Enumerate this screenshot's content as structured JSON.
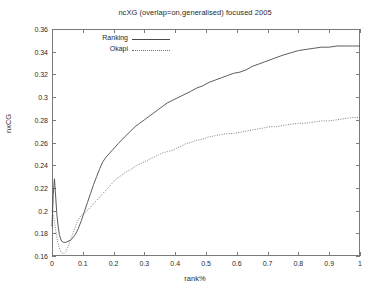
{
  "chart_data": {
    "type": "line",
    "title": "ncXG (overlap=on,generalised) focused 2005",
    "xlabel": "rank%",
    "ylabel": "nxCG",
    "xlim": [
      0,
      1
    ],
    "ylim": [
      0.16,
      0.36
    ],
    "grid": false,
    "legend_position": "top-left-inside",
    "xticks": [
      "0",
      "0.1",
      "0.2",
      "0.3",
      "0.4",
      "0.5",
      "0.6",
      "0.7",
      "0.8",
      "0.9",
      "1"
    ],
    "xtick_values": [
      0,
      0.1,
      0.2,
      0.3,
      0.4,
      0.5,
      0.6,
      0.7,
      0.8,
      0.9,
      1
    ],
    "yticks": [
      "0.16",
      "0.18",
      "0.2",
      "0.22",
      "0.24",
      "0.26",
      "0.28",
      "0.3",
      "0.32",
      "0.34",
      "0.36"
    ],
    "ytick_values": [
      0.16,
      0.18,
      0.2,
      0.22,
      0.24,
      0.26,
      0.28,
      0.3,
      0.32,
      0.34,
      0.36
    ],
    "series": [
      {
        "name": "Ranking",
        "style": "solid",
        "color": "#4a4a4a",
        "x": [
          0.0,
          0.004,
          0.008,
          0.012,
          0.016,
          0.02,
          0.024,
          0.028,
          0.032,
          0.038,
          0.045,
          0.052,
          0.06,
          0.068,
          0.076,
          0.085,
          0.095,
          0.105,
          0.115,
          0.125,
          0.135,
          0.145,
          0.155,
          0.165,
          0.175,
          0.185,
          0.195,
          0.205,
          0.215,
          0.225,
          0.24,
          0.255,
          0.27,
          0.285,
          0.3,
          0.315,
          0.33,
          0.345,
          0.36,
          0.375,
          0.39,
          0.405,
          0.42,
          0.435,
          0.45,
          0.47,
          0.49,
          0.51,
          0.53,
          0.55,
          0.57,
          0.59,
          0.61,
          0.63,
          0.65,
          0.67,
          0.69,
          0.71,
          0.73,
          0.75,
          0.775,
          0.8,
          0.825,
          0.85,
          0.875,
          0.9,
          0.925,
          0.95,
          0.975,
          1.0
        ],
        "y": [
          0.186,
          0.214,
          0.228,
          0.212,
          0.196,
          0.186,
          0.179,
          0.175,
          0.173,
          0.172,
          0.172,
          0.173,
          0.174,
          0.176,
          0.179,
          0.184,
          0.191,
          0.199,
          0.207,
          0.215,
          0.223,
          0.23,
          0.237,
          0.243,
          0.247,
          0.25,
          0.253,
          0.256,
          0.259,
          0.262,
          0.266,
          0.27,
          0.274,
          0.277,
          0.28,
          0.283,
          0.286,
          0.289,
          0.292,
          0.295,
          0.297,
          0.299,
          0.301,
          0.303,
          0.305,
          0.308,
          0.31,
          0.313,
          0.315,
          0.317,
          0.319,
          0.321,
          0.322,
          0.324,
          0.327,
          0.329,
          0.331,
          0.333,
          0.335,
          0.337,
          0.339,
          0.341,
          0.342,
          0.343,
          0.344,
          0.344,
          0.345,
          0.345,
          0.345,
          0.345
        ]
      },
      {
        "name": "Okapi",
        "style": "dotted",
        "color": "#6f6f6f",
        "x": [
          0.0,
          0.004,
          0.008,
          0.012,
          0.016,
          0.02,
          0.024,
          0.028,
          0.032,
          0.038,
          0.045,
          0.052,
          0.06,
          0.068,
          0.076,
          0.085,
          0.095,
          0.105,
          0.115,
          0.125,
          0.135,
          0.145,
          0.155,
          0.165,
          0.175,
          0.185,
          0.195,
          0.205,
          0.215,
          0.225,
          0.24,
          0.255,
          0.27,
          0.285,
          0.3,
          0.315,
          0.33,
          0.345,
          0.36,
          0.375,
          0.39,
          0.405,
          0.42,
          0.435,
          0.45,
          0.47,
          0.49,
          0.51,
          0.53,
          0.55,
          0.57,
          0.59,
          0.61,
          0.63,
          0.65,
          0.67,
          0.69,
          0.71,
          0.73,
          0.75,
          0.775,
          0.8,
          0.825,
          0.85,
          0.875,
          0.9,
          0.925,
          0.95,
          0.975,
          1.0
        ],
        "y": [
          0.2,
          0.196,
          0.19,
          0.183,
          0.176,
          0.171,
          0.167,
          0.164,
          0.163,
          0.162,
          0.164,
          0.168,
          0.174,
          0.18,
          0.186,
          0.192,
          0.196,
          0.198,
          0.2,
          0.203,
          0.206,
          0.209,
          0.212,
          0.215,
          0.218,
          0.221,
          0.224,
          0.227,
          0.229,
          0.231,
          0.234,
          0.236,
          0.239,
          0.241,
          0.243,
          0.245,
          0.247,
          0.249,
          0.251,
          0.252,
          0.253,
          0.255,
          0.257,
          0.259,
          0.26,
          0.262,
          0.263,
          0.265,
          0.266,
          0.267,
          0.268,
          0.268,
          0.269,
          0.27,
          0.271,
          0.272,
          0.273,
          0.274,
          0.274,
          0.275,
          0.276,
          0.277,
          0.277,
          0.278,
          0.279,
          0.279,
          0.28,
          0.281,
          0.282,
          0.282
        ]
      }
    ]
  }
}
